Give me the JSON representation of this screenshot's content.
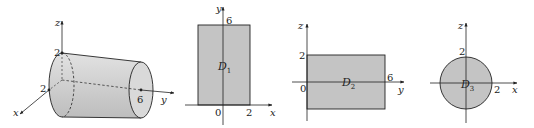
{
  "figure": {
    "panels": [
      {
        "id": "cylinder",
        "description": "3D cylinder of radius 2 along y-axis from 0 to 6",
        "axes": {
          "z": "z",
          "x": "x",
          "y": "y"
        },
        "labels": {
          "z_radius": "2",
          "x_radius": "2",
          "y_length": "6"
        }
      },
      {
        "id": "D1",
        "description": "Projection onto xy-plane: rectangle",
        "axes": {
          "vertical": "y",
          "horizontal": "x"
        },
        "labels": {
          "top": "6",
          "origin": "0",
          "right": "2",
          "region": "D",
          "region_sub": "1"
        }
      },
      {
        "id": "D2",
        "description": "Projection onto yz-plane: rectangle",
        "axes": {
          "vertical": "z",
          "horizontal": "y"
        },
        "labels": {
          "top": "2",
          "origin": "0",
          "right": "6",
          "region": "D",
          "region_sub": "2"
        }
      },
      {
        "id": "D3",
        "description": "Projection onto xz-plane: disk of radius 2",
        "axes": {
          "vertical": "z",
          "horizontal": "x"
        },
        "labels": {
          "top": "2",
          "right": "2",
          "region": "D",
          "region_sub": "3"
        }
      }
    ],
    "colors": {
      "fill": "#c4c4c4",
      "cylinder_fill": "#d6d6d6",
      "stroke": "#333333"
    }
  }
}
